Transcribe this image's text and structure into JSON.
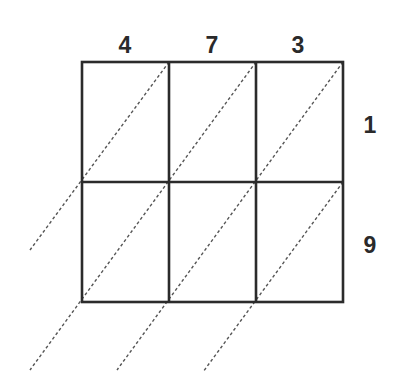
{
  "diagram": {
    "type": "lattice-multiplication-grid",
    "multiplicand_digits": [
      "4",
      "7",
      "3"
    ],
    "multiplier_digits": [
      "1",
      "9"
    ],
    "grid": {
      "columns": 3,
      "rows": 2,
      "left": 82,
      "top": 62,
      "cell_width": 87,
      "cell_height": 120,
      "line_color": "#2b2b2b",
      "diagonal_color": "#555555"
    },
    "diagonals": [
      {
        "x1": 169,
        "y1": 62,
        "x2": 30,
        "y2": 250
      },
      {
        "x1": 256,
        "y1": 62,
        "x2": 30,
        "y2": 370
      },
      {
        "x1": 343,
        "y1": 62,
        "x2": 117,
        "y2": 370
      },
      {
        "x1": 343,
        "y1": 182,
        "x2": 203,
        "y2": 372
      }
    ],
    "top_labels": [
      {
        "text": "4",
        "x": 125,
        "y": 45
      },
      {
        "text": "7",
        "x": 212,
        "y": 45
      },
      {
        "text": "3",
        "x": 298,
        "y": 45
      }
    ],
    "side_labels": [
      {
        "text": "1",
        "x": 370,
        "y": 125
      },
      {
        "text": "9",
        "x": 370,
        "y": 245
      }
    ]
  }
}
